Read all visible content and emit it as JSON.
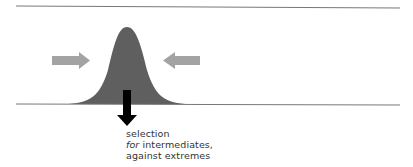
{
  "diagram": {
    "type": "stabilizing-selection",
    "colors": {
      "lines": "#777777",
      "curve": "#5f5f5f",
      "side_arrows": "#a3a3a3",
      "selection_arrow": "#000000",
      "text": "#333333"
    },
    "caption": {
      "line1": "selection",
      "line2_italic": "for",
      "line2_rest": " intermediates,",
      "line3": "against extremes"
    }
  }
}
